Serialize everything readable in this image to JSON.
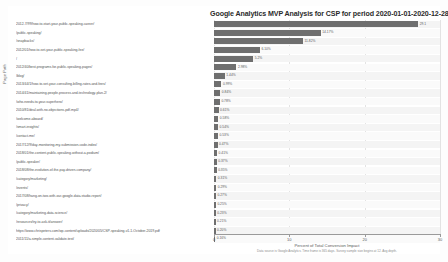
{
  "chart_data": {
    "type": "bar",
    "orientation": "horizontal",
    "title": "Google Analytics MVP Analysis for CSP for period 2020-01-01-2020-12-28",
    "xlabel": "Percent of Total Conversion Impact",
    "ylabel": "Page Path",
    "footnote": "Data source is Google Analytics. Time frame is 365 days. Survey sample size begins at 12. Avg depth.",
    "xlim": [
      0,
      30
    ],
    "xticks": [
      0,
      10,
      20,
      30
    ],
    "xtick_labels": [
      "0",
      "10",
      "20",
      "30"
    ],
    "grid": true,
    "legend": "none",
    "bar_color": "#6f6f6f",
    "categories": [
      "2012-7/99/how-to-start-your-public-speaking-career/",
      "/public-speaking/",
      "/snapbacks/",
      "2012/01/how-to-set-your-public-speaking-fee/",
      "/",
      "2012/40/best-programs-for-public-speaking-pages/",
      "/blog/",
      "2013/44/1/how-to-set-your-consulting-billing-rates-and-fees/",
      "2014/41/maintaining-people-process-and-technology-plan-2/",
      "/who-needs-to-your-superhero/",
      "2010/81/deal-with-no-objections-pdf-mp4/",
      "/welcome-aboard/",
      "/smart-insights/",
      "/contact-me/",
      "2017/12/9/day-monitoring-my-submission-code-index/",
      "2018/01/the-content-public-speaking-without-a-podium/",
      "/public-speaker/",
      "2018/08/the-evolution-of-the-pay-driven-company/",
      "/category/marketing/",
      "/events/",
      "2017/08/hang-on-two-with-our-google-data-studio-report/",
      "/privacy/",
      "/category/marketing-data-science/",
      "/resources/try-to-ask-it/answer/",
      "https://www.chrispeters.com/wp-content/uploads/2020/05/CSP-speaking-v1-1-October-2019.pdf",
      "2011/11/a-simple-content-validate-test/"
    ],
    "values": [
      27.1,
      14.17,
      11.82,
      6.1,
      5.2,
      2.98,
      1.44,
      0.99,
      0.84,
      0.78,
      0.61,
      0.58,
      0.54,
      0.53,
      0.47,
      0.41,
      0.37,
      0.35,
      0.31,
      0.29,
      0.27,
      0.25,
      0.23,
      0.21,
      0.2,
      0.16
    ],
    "value_labels": [
      "29.1",
      "14.17%",
      "11.82%",
      "6.10%",
      "5.2%",
      "2.98%",
      "1.44%",
      "0.99%",
      "0.84%",
      "0.78%",
      "0.61%",
      "0.58%",
      "0.54%",
      "0.53%",
      "0.47%",
      "0.41%",
      "0.37%",
      "0.35%",
      "0.31%",
      "0.29%",
      "0.27%",
      "0.25%",
      "0.23%",
      "0.21%",
      "0.20%",
      "0.16%"
    ]
  }
}
